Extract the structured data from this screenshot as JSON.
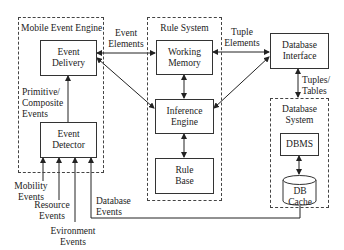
{
  "groups": {
    "mobile_event_engine": "Mobile Event Engine",
    "rule_system": "Rule System",
    "database_system": "Database System"
  },
  "components": {
    "event_delivery": "Event Delivery",
    "event_detector": "Event Detector",
    "working_memory": "Working Memory",
    "inference_engine": "Inference Engine",
    "rule_base": "Rule Base",
    "database_interface": "Database Interface",
    "dbms": "DBMS",
    "db_cache": "DB Cache"
  },
  "edge_labels": {
    "event_elements": "Event Elements",
    "tuple_elements": "Tuple Elements",
    "primitive_composite_events": "Primitive/ Composite Events",
    "tuples_tables": "Tuples/ Tables",
    "mobility_events": "Mobility Events",
    "resource_events": "Resource Events",
    "environment_events": "Evironment Events",
    "database_events": "Database Events"
  }
}
